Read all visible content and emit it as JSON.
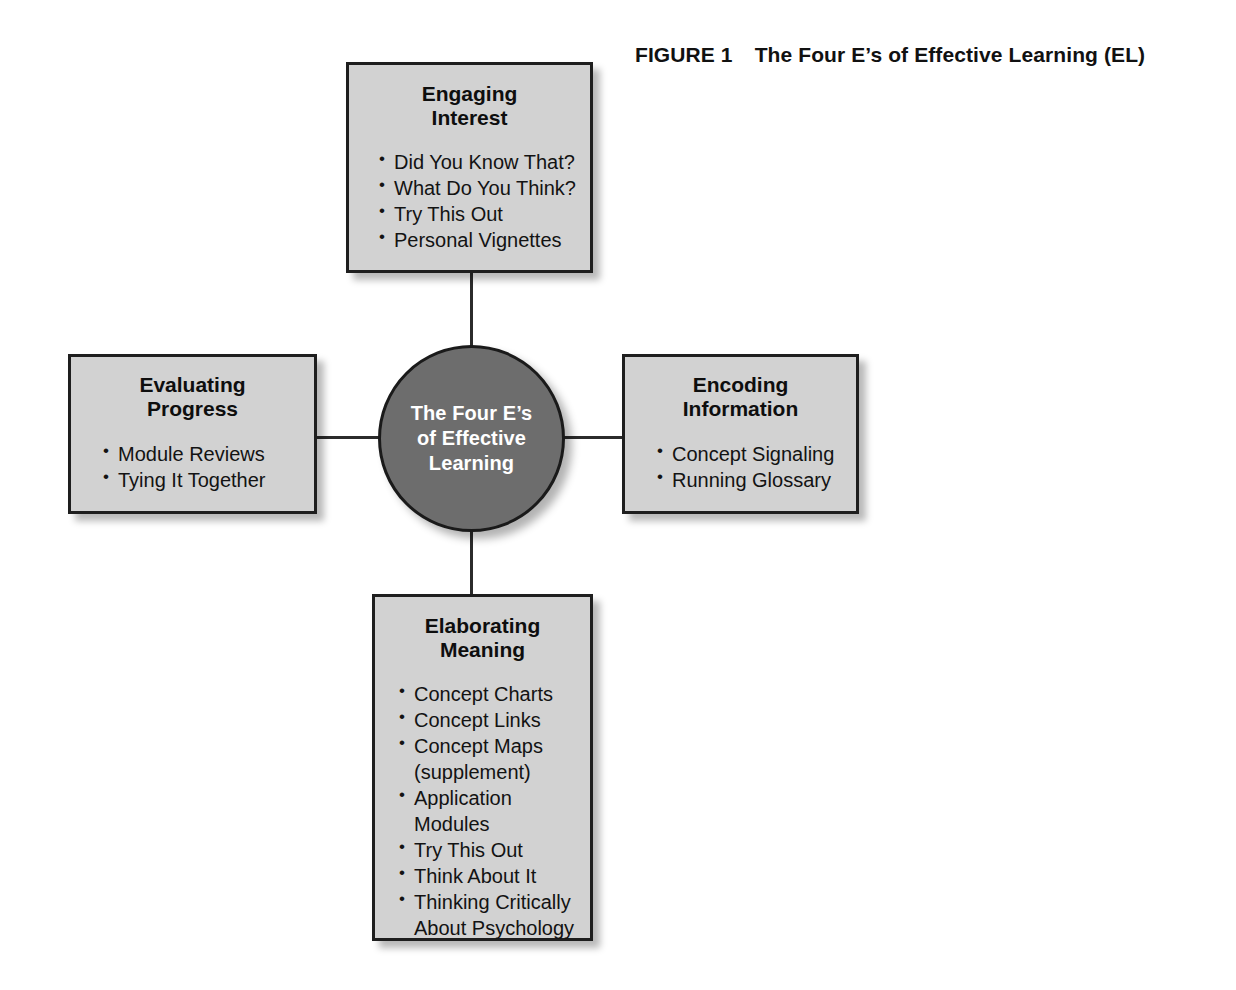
{
  "figure": {
    "label": "FIGURE 1",
    "title": "The Four E’s of Effective Learning (EL)"
  },
  "center": {
    "text": "The Four E’s\nof Effective\nLearning",
    "fill_color": "#6d6d6d",
    "text_color": "#ffffff"
  },
  "colors": {
    "box_fill": "#d2d2d2",
    "box_border": "#1e1e1e",
    "line": "#2b2b2b",
    "page_background": "#ffffff"
  },
  "nodes": {
    "top": {
      "title": "Engaging\nInterest",
      "items": [
        "Did You Know That?",
        "What Do You Think?",
        "Try This Out",
        "Personal Vignettes"
      ]
    },
    "left": {
      "title": "Evaluating\nProgress",
      "items": [
        "Module Reviews",
        "Tying It Together"
      ]
    },
    "right": {
      "title": "Encoding\nInformation",
      "items": [
        "Concept Signaling",
        "Running Glossary"
      ]
    },
    "bottom": {
      "title": "Elaborating\nMeaning",
      "items": [
        "Concept Charts",
        "Concept Links",
        "Concept Maps",
        "(supplement)",
        "Application Modules",
        "Try This Out",
        "Think About It",
        "Thinking Critically",
        "About Psychology"
      ]
    }
  }
}
